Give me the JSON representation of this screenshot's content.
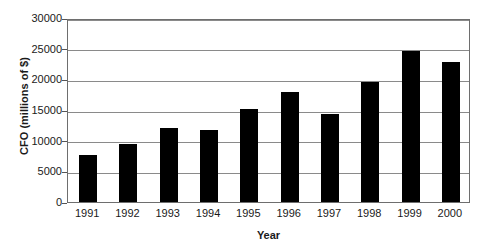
{
  "chart_data": {
    "type": "bar",
    "title": "",
    "xlabel": "Year",
    "ylabel": "CFO (millions of $)",
    "categories": [
      "1991",
      "1992",
      "1993",
      "1994",
      "1995",
      "1996",
      "1997",
      "1998",
      "1999",
      "2000"
    ],
    "values": [
      7600,
      9500,
      12100,
      11800,
      15100,
      17900,
      14400,
      19500,
      24700,
      22800
    ],
    "series": [
      {
        "name": "CFO",
        "values": [
          7600,
          9500,
          12100,
          11800,
          15100,
          17900,
          14400,
          19500,
          24700,
          22800
        ]
      }
    ],
    "ylim": [
      0,
      30000
    ],
    "ytick_values": [
      0,
      5000,
      10000,
      15000,
      20000,
      25000,
      30000
    ],
    "ytick_labels": [
      "0",
      "5000",
      "10000",
      "15000",
      "20000",
      "25000",
      "30000"
    ],
    "grid": true,
    "grid_axis": "y",
    "legend": false,
    "legend_position": "none",
    "bar_color": "#000000",
    "grid_color": "#8a8a8a",
    "frame_color": "#6e6e6e",
    "background_color": "#ffffff"
  }
}
